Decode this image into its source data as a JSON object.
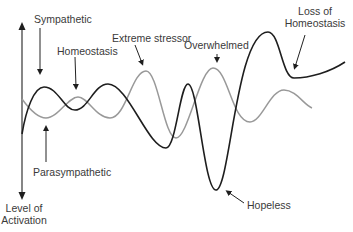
{
  "diagram": {
    "type": "stress-activation-curves",
    "axis": {
      "label_line1": "Level of",
      "label_line2": "Activation"
    },
    "labels": {
      "sympathetic": "Sympathetic",
      "homeostasis": "Homeostasis",
      "extreme_stressor": "Extreme stressor",
      "overwhelmed": "Overwhelmed",
      "loss_line1": "Loss of",
      "loss_line2": "Homeostasis",
      "parasympathetic": "Parasympathetic",
      "hopeless": "Hopeless"
    },
    "series": [
      {
        "name": "Sympathetic activation",
        "color": "#1e1e1e"
      },
      {
        "name": "Parasympathetic activation",
        "color": "#999999"
      }
    ]
  }
}
